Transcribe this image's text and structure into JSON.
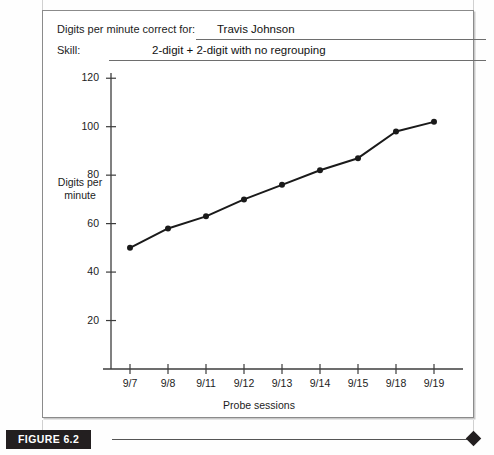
{
  "figure": {
    "tag": "FIGURE 6.2",
    "header": {
      "name_label": "Digits per minute correct for:",
      "name_value": "Travis Johnson",
      "skill_label": "Skill:",
      "skill_value": "2-digit + 2-digit with no regrouping"
    }
  },
  "chart_data": {
    "type": "line",
    "title": "",
    "xlabel": "Probe sessions",
    "ylabel": "Digits per minute",
    "ylabel_lines": [
      "Digits per",
      "minute"
    ],
    "categories": [
      "9/7",
      "9/8",
      "9/11",
      "9/12",
      "9/13",
      "9/14",
      "9/15",
      "9/18",
      "9/19"
    ],
    "values": [
      50,
      58,
      63,
      70,
      76,
      82,
      87,
      98,
      102
    ],
    "yticks": [
      20,
      40,
      60,
      80,
      100,
      120
    ],
    "ylim": [
      0,
      130
    ],
    "grid": false,
    "legend": "none",
    "marker": "filled-circle",
    "line_color": "#1a1a1a",
    "series": [
      {
        "name": "Digits per minute correct",
        "values": [
          50,
          58,
          63,
          70,
          76,
          82,
          87,
          98,
          102
        ]
      }
    ]
  }
}
